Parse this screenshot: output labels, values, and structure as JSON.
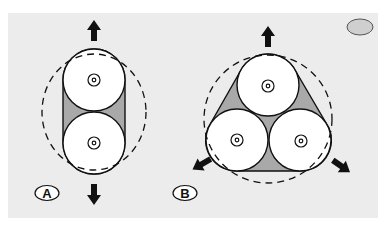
{
  "figure": {
    "panel_color": "#ececec",
    "fill_gray": "#a9a9a9",
    "stroke_color": "#111111",
    "corner_marker": {
      "color": "#cfcfcf"
    },
    "panels": [
      {
        "id": "A",
        "label": "A",
        "description": "Two-roller arrangement with dashed elliptical envelope",
        "rollers": 2,
        "arrows": [
          "up",
          "down"
        ]
      },
      {
        "id": "B",
        "label": "B",
        "description": "Three-roller triangular arrangement with dashed circular envelope",
        "rollers": 3,
        "arrows": [
          "up",
          "down-left",
          "down-right"
        ]
      }
    ]
  }
}
